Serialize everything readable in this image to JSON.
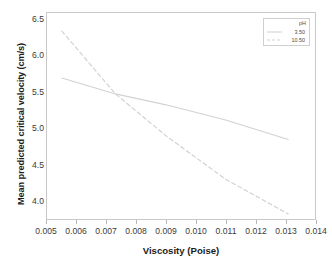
{
  "chart_data": {
    "type": "line",
    "title": "",
    "xlabel": "Viscosity (Poise)",
    "ylabel": "Mean predicted critical velocity (cm/s)",
    "xlim": [
      0.005,
      0.014
    ],
    "ylim": [
      3.75,
      6.6
    ],
    "xticks": [
      "0.005",
      "0.006",
      "0.007",
      "0.008",
      "0.009",
      "0.010",
      "0.011",
      "0.012",
      "0.013",
      "0.014"
    ],
    "xtick_values": [
      0.005,
      0.006,
      0.007,
      0.008,
      0.009,
      0.01,
      0.011,
      0.012,
      0.013,
      0.014
    ],
    "yticks": [
      "4.0",
      "4.5",
      "5.0",
      "5.5",
      "6.0",
      "6.5"
    ],
    "ytick_values": [
      4.0,
      4.5,
      5.0,
      5.5,
      6.0,
      6.5
    ],
    "grid": false,
    "legend_position": "upper right inside",
    "legend_title": "pH",
    "series": [
      {
        "name": "3.50",
        "style": "solid",
        "color": "#d2d2d2",
        "x": [
          0.0055,
          0.0073,
          0.009,
          0.011,
          0.0131
        ],
        "values": [
          5.7,
          5.48,
          5.33,
          5.12,
          4.85
        ]
      },
      {
        "name": "10.50",
        "style": "dashed",
        "color": "#d2d2d2",
        "x": [
          0.0055,
          0.0073,
          0.009,
          0.011,
          0.0131
        ],
        "values": [
          6.35,
          5.48,
          4.9,
          4.3,
          3.82
        ]
      }
    ],
    "annotations": {
      "crossover_x": 0.0073,
      "crossover_y": 5.48
    }
  },
  "figure": {
    "y_axis_title": "Mean predicted critical velocity (cm/s)",
    "x_axis_title": "Viscosity (Poise)"
  },
  "legend": {
    "title": "pH",
    "entries": [
      {
        "label": "3.50"
      },
      {
        "label": "10.50"
      }
    ]
  },
  "caption": {
    "cropped_text": ""
  }
}
